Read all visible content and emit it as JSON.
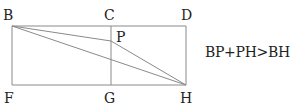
{
  "diagram": {
    "type": "geometry",
    "colors": {
      "line": "#8a8a8a",
      "text": "#222222",
      "background": "#ffffff"
    },
    "points": {
      "B": {
        "label": "B",
        "x": 12,
        "y": 26,
        "lx": 3,
        "ly": 20
      },
      "C": {
        "label": "C",
        "x": 111,
        "y": 26,
        "lx": 104,
        "ly": 20
      },
      "D": {
        "label": "D",
        "x": 186,
        "y": 26,
        "lx": 181,
        "ly": 20
      },
      "P": {
        "label": "P",
        "x": 111,
        "y": 41,
        "lx": 116,
        "ly": 42
      },
      "F": {
        "label": "F",
        "x": 12,
        "y": 85,
        "lx": 4,
        "ly": 103
      },
      "G": {
        "label": "G",
        "x": 111,
        "y": 85,
        "lx": 104,
        "ly": 103
      },
      "H": {
        "label": "H",
        "x": 186,
        "y": 85,
        "lx": 180,
        "ly": 103
      }
    },
    "segments": [
      [
        "B",
        "D"
      ],
      [
        "D",
        "H"
      ],
      [
        "H",
        "F"
      ],
      [
        "F",
        "B"
      ],
      [
        "C",
        "G"
      ],
      [
        "B",
        "P"
      ],
      [
        "P",
        "H"
      ],
      [
        "B",
        "H"
      ]
    ],
    "formula": "BP+PH>BH"
  }
}
